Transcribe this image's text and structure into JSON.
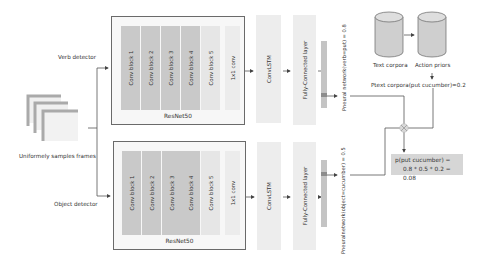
{
  "input": {
    "label": "Uniformely samples frames",
    "icon": "stacked-frames-icon"
  },
  "branches": [
    {
      "id": "verb",
      "label": "Verb detector",
      "backbone": {
        "name": "ResNet50",
        "blocks": [
          "Conv block 1",
          "Conv block 2",
          "Conv block 3",
          "Conv block 4",
          "Conv block 5",
          "1x1 conv"
        ]
      },
      "convlstm": "ConvLSTM",
      "fc": "Fully-Connected layer",
      "output": "Pneural network(verb=put) = 0.8"
    },
    {
      "id": "object",
      "label": "Object detector",
      "backbone": {
        "name": "ResNet50",
        "blocks": [
          "Conv block 1",
          "Conv block 2",
          "Conv block 3",
          "Conv block 4",
          "Conv block 5",
          "1x1 conv"
        ]
      },
      "convlstm": "ConvLSTM",
      "fc": "Fully-Connected layer",
      "output": "Pneuralnetwork(object=cucumber) = 0.5"
    }
  ],
  "priors": {
    "source_label": "Text corpora",
    "target_label": "Action priors",
    "probability": "Ptext corpora(put cucumber)=0.2"
  },
  "combine": {
    "operator_icon": "multiply-node-icon",
    "result_line1": "p(put cucumber) =",
    "result_line2": "0.8 * 0.5 * 0.2 = 0.08"
  },
  "colors": {
    "dark_block": "#c9c9c9",
    "light_block": "#e6e6e6",
    "panel": "#f7f7f7",
    "result_bg": "#d6d6d6",
    "line": "#555555"
  }
}
